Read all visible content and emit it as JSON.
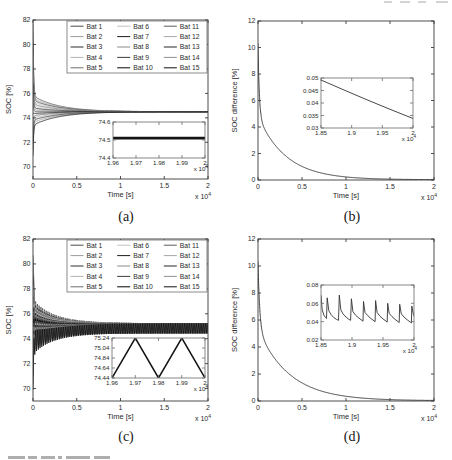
{
  "figure": {
    "background": "#ffffff",
    "frame_color": "#3a3a3a",
    "inset_frame_color": "#6a6a6a",
    "text_color": "#2b2b2b"
  },
  "batteries": [
    {
      "label": "Bat 1",
      "color": "#4a4a4a",
      "start": 81.7,
      "slow": 1.3
    },
    {
      "label": "Bat 2",
      "color": "#9b9b9b",
      "start": 80.9,
      "slow": 1.12
    },
    {
      "label": "Bat 3",
      "color": "#2e2e2e",
      "start": 80.1,
      "slow": 0.95
    },
    {
      "label": "Bat 4",
      "color": "#b3b3b3",
      "start": 79.3,
      "slow": 0.78
    },
    {
      "label": "Bat 5",
      "color": "#6e6e6e",
      "start": 78.4,
      "slow": 0.61
    },
    {
      "label": "Bat 6",
      "color": "#c0c0c0",
      "start": 77.6,
      "slow": 0.45
    },
    {
      "label": "Bat 7",
      "color": "#1c1c1c",
      "start": 76.8,
      "slow": 0.3
    },
    {
      "label": "Bat 8",
      "color": "#8a8a8a",
      "start": 76.0,
      "slow": 0.15
    },
    {
      "label": "Bat 9",
      "color": "#3d3d3d",
      "start": 75.2,
      "slow": 0.0
    },
    {
      "label": "Bat 10",
      "color": "#060606",
      "start": 74.4,
      "slow": -0.15
    },
    {
      "label": "Bat 11",
      "color": "#5c5c5c",
      "start": 73.6,
      "slow": -0.32
    },
    {
      "label": "Bat 12",
      "color": "#a6a6a6",
      "start": 72.8,
      "slow": -0.5
    },
    {
      "label": "Bat 13",
      "color": "#262626",
      "start": 72.0,
      "slow": -0.68
    },
    {
      "label": "Bat 14",
      "color": "#919191",
      "start": 71.4,
      "slow": -0.88
    },
    {
      "label": "Bat 15",
      "color": "#101010",
      "start": 70.9,
      "slow": -1.1
    }
  ],
  "chart_data": [
    {
      "id": "a",
      "type": "line",
      "sublabel": "(a)",
      "xlabel": "Time [s]",
      "ylabel": "SOC [%]",
      "xlim": [
        0,
        20000
      ],
      "ylim": [
        69,
        82
      ],
      "plot_box": [
        33,
        20,
        208,
        179
      ],
      "xticks": {
        "values": [
          0,
          5000,
          10000,
          15000,
          20000
        ],
        "labels": [
          "0",
          "0.5",
          "1",
          "1.5",
          "2"
        ]
      },
      "yticks": {
        "values": [
          70,
          72,
          74,
          76,
          78,
          80,
          82
        ],
        "labels": [
          "70",
          "72",
          "74",
          "76",
          "78",
          "80",
          "82"
        ]
      },
      "x_multiplier": {
        "base": "x 10",
        "exp": "4"
      },
      "series_from_batteries": {
        "base": 74.5,
        "t_fast": 70,
        "t_slow": 3000
      },
      "legend": {
        "columns": 3,
        "rows": 5,
        "box": [
          67,
          21,
          207,
          73
        ]
      },
      "inset": {
        "plot_box": [
          113,
          122,
          205,
          158
        ],
        "xlim": [
          19600,
          20000
        ],
        "ylim": [
          74.4,
          74.6
        ],
        "xticks": {
          "values": [
            19600,
            19700,
            19800,
            19900,
            20000
          ],
          "labels": [
            "1.96",
            "1.97",
            "1.98",
            "1.99",
            "2"
          ]
        },
        "yticks": {
          "values": [
            74.4,
            74.5,
            74.6
          ],
          "labels": [
            "74.4",
            "74.5",
            "74.6"
          ]
        },
        "x_multiplier": {
          "base": "x 10",
          "exp": "4"
        },
        "series": [
          {
            "type": "points",
            "color": "#141414",
            "width": 2.8,
            "pts": [
              [
                19600,
                74.51
              ],
              [
                20000,
                74.51
              ]
            ]
          }
        ]
      }
    },
    {
      "id": "b",
      "type": "line",
      "sublabel": "(b)",
      "xlabel": "Time [s]",
      "ylabel": "SOC difference [%]",
      "xlim": [
        0,
        20000
      ],
      "ylim": [
        0,
        12
      ],
      "plot_box": [
        32,
        21,
        208,
        180
      ],
      "xticks": {
        "values": [
          0,
          5000,
          10000,
          15000,
          20000
        ],
        "labels": [
          "0",
          "0.5",
          "1",
          "1.5",
          "2"
        ]
      },
      "yticks": {
        "values": [
          0,
          2,
          4,
          6,
          8,
          10,
          12
        ],
        "labels": [
          "0",
          "2",
          "4",
          "6",
          "8",
          "10",
          "12"
        ]
      },
      "x_multiplier": {
        "base": "x 10",
        "exp": "4"
      },
      "series": [
        {
          "type": "exp2",
          "base": 0.02,
          "a1": 5.5,
          "t1": 150,
          "a2": 4.8,
          "t2": 3200,
          "color": "#2e2e2e",
          "width": 0.9
        }
      ],
      "inset": {
        "plot_box": [
          95,
          78,
          187,
          128
        ],
        "xlim": [
          18500,
          20000
        ],
        "ylim": [
          0.03,
          0.05
        ],
        "xticks": {
          "values": [
            18500,
            19000,
            19500,
            20000
          ],
          "labels": [
            "1.85",
            "1.9",
            "1.95",
            "2"
          ]
        },
        "yticks": {
          "values": [
            0.03,
            0.035,
            0.04,
            0.045,
            0.05
          ],
          "labels": [
            "0.03",
            "0.035",
            "0.04",
            "0.045",
            "0.05"
          ]
        },
        "x_multiplier": {
          "base": "x 10",
          "exp": "4"
        },
        "series": [
          {
            "type": "points",
            "color": "#333333",
            "width": 0.9,
            "pts": [
              [
                18500,
                0.0492
              ],
              [
                18875,
                0.0452
              ],
              [
                19250,
                0.0413
              ],
              [
                19625,
                0.0375
              ],
              [
                20000,
                0.0338
              ]
            ]
          }
        ]
      }
    },
    {
      "id": "c",
      "type": "line",
      "sublabel": "(c)",
      "xlabel": "Time [s]",
      "ylabel": "SOC [%]",
      "xlim": [
        0,
        20000
      ],
      "ylim": [
        69,
        82
      ],
      "plot_box": [
        33,
        9,
        208,
        171
      ],
      "xticks": {
        "values": [
          0,
          5000,
          10000,
          15000,
          20000
        ],
        "labels": [
          "0",
          "0.5",
          "1",
          "1.5",
          "2"
        ]
      },
      "yticks": {
        "values": [
          70,
          72,
          74,
          76,
          78,
          80,
          82
        ],
        "labels": [
          "70",
          "72",
          "74",
          "76",
          "78",
          "80",
          "82"
        ]
      },
      "x_multiplier": {
        "base": "x 10",
        "exp": "4"
      },
      "series_from_batteries": {
        "base": 74.84,
        "t_fast": 70,
        "t_slow": 3000,
        "osc": {
          "period": 200,
          "amp_start": 1.0,
          "amp_end": 0.4,
          "amp_tau": 1500
        }
      },
      "legend": {
        "columns": 3,
        "rows": 5,
        "box": [
          67,
          10,
          207,
          62
        ]
      },
      "inset": {
        "plot_box": [
          112,
          108,
          205,
          148
        ],
        "xlim": [
          19600,
          20000
        ],
        "ylim": [
          74.44,
          75.24
        ],
        "xticks": {
          "values": [
            19600,
            19700,
            19800,
            19900,
            20000
          ],
          "labels": [
            "1.96",
            "1.97",
            "1.98",
            "1.99",
            "2"
          ]
        },
        "yticks": {
          "values": [
            74.44,
            74.64,
            74.84,
            75.04,
            75.24
          ],
          "labels": [
            "74.44",
            "74.64",
            "74.84",
            "75.04",
            "75.24"
          ]
        },
        "x_multiplier": {
          "base": "x 10",
          "exp": "4"
        },
        "series": [
          {
            "type": "points",
            "color": "#141414",
            "width": 1.5,
            "pts": [
              [
                19600,
                74.44
              ],
              [
                19700,
                75.24
              ],
              [
                19800,
                74.44
              ],
              [
                19900,
                75.24
              ],
              [
                20000,
                74.44
              ]
            ]
          }
        ]
      }
    },
    {
      "id": "d",
      "type": "line",
      "sublabel": "(d)",
      "xlabel": "Time [s]",
      "ylabel": "SOC difference [%]",
      "xlim": [
        0,
        20000
      ],
      "ylim": [
        0,
        12
      ],
      "plot_box": [
        32,
        9,
        208,
        171
      ],
      "xticks": {
        "values": [
          0,
          5000,
          10000,
          15000,
          20000
        ],
        "labels": [
          "0",
          "0.5",
          "1",
          "1.5",
          "2"
        ]
      },
      "yticks": {
        "values": [
          0,
          2,
          4,
          6,
          8,
          10,
          12
        ],
        "labels": [
          "0",
          "2",
          "4",
          "6",
          "8",
          "10",
          "12"
        ]
      },
      "x_multiplier": {
        "base": "x 10",
        "exp": "4"
      },
      "series": [
        {
          "type": "exp2",
          "base": 0.02,
          "a1": 5.0,
          "t1": 200,
          "a2": 5.3,
          "t2": 3600,
          "color": "#2e2e2e",
          "width": 0.9
        }
      ],
      "inset": {
        "plot_box": [
          95,
          55,
          188,
          110
        ],
        "xlim": [
          18500,
          20000
        ],
        "ylim": [
          0.02,
          0.08
        ],
        "xticks": {
          "values": [
            18500,
            19000,
            19500,
            20000
          ],
          "labels": [
            "1.85",
            "1.9",
            "1.95",
            "2"
          ]
        },
        "yticks": {
          "values": [
            0.02,
            0.04,
            0.06,
            0.08
          ],
          "labels": [
            "0.02",
            "0.04",
            "0.06",
            "0.08"
          ]
        },
        "x_multiplier": {
          "base": "x 10",
          "exp": "4"
        },
        "series": [
          {
            "type": "points",
            "color": "#333333",
            "width": 0.9,
            "pts": [
              [
                18500,
                0.069
              ],
              [
                18520,
                0.053
              ],
              [
                18548,
                0.047
              ],
              [
                18572,
                0.0445
              ],
              [
                18588,
                0.0435
              ],
              [
                18600,
                0.066
              ],
              [
                18625,
                0.052
              ],
              [
                18660,
                0.048
              ],
              [
                18705,
                0.0445
              ],
              [
                18750,
                0.0425
              ],
              [
                18782,
                0.0415
              ],
              [
                18795,
                0.069
              ],
              [
                18820,
                0.053
              ],
              [
                18855,
                0.0485
              ],
              [
                18905,
                0.045
              ],
              [
                18950,
                0.0425
              ],
              [
                18978,
                0.0415
              ],
              [
                18990,
                0.065
              ],
              [
                19015,
                0.051
              ],
              [
                19060,
                0.047
              ],
              [
                19110,
                0.044
              ],
              [
                19160,
                0.0415
              ],
              [
                19177,
                0.0405
              ],
              [
                19185,
                0.062
              ],
              [
                19210,
                0.05
              ],
              [
                19255,
                0.0465
              ],
              [
                19305,
                0.0435
              ],
              [
                19355,
                0.041
              ],
              [
                19372,
                0.04
              ],
              [
                19380,
                0.063
              ],
              [
                19405,
                0.05
              ],
              [
                19450,
                0.046
              ],
              [
                19500,
                0.043
              ],
              [
                19550,
                0.0405
              ],
              [
                19568,
                0.0395
              ],
              [
                19575,
                0.06
              ],
              [
                19600,
                0.049
              ],
              [
                19645,
                0.0455
              ],
              [
                19695,
                0.0425
              ],
              [
                19745,
                0.04
              ],
              [
                19762,
                0.039
              ],
              [
                19770,
                0.059
              ],
              [
                19795,
                0.0485
              ],
              [
                19840,
                0.045
              ],
              [
                19890,
                0.042
              ],
              [
                19940,
                0.0395
              ],
              [
                19958,
                0.0385
              ],
              [
                19965,
                0.057
              ],
              [
                19990,
                0.048
              ],
              [
                20000,
                0.046
              ]
            ]
          }
        ]
      }
    }
  ]
}
